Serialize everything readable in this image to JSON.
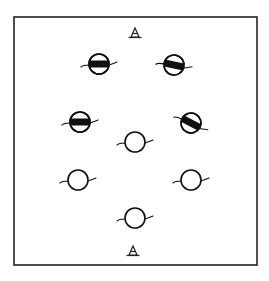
{
  "diagram": {
    "title": "",
    "frame": {
      "x": 14,
      "y": 17,
      "width": 243,
      "height": 248
    },
    "colors": {
      "stroke": "#111111",
      "background": "#ffffff"
    },
    "markers": [
      {
        "id": "top-marker",
        "type": "triangle",
        "x": 135,
        "y": 33
      },
      {
        "id": "bottom-marker",
        "type": "triangle",
        "x": 133,
        "y": 251
      }
    ],
    "figures": [
      {
        "id": "fig-1",
        "state": "half-filled",
        "x": 99,
        "y": 64,
        "tilt": 0
      },
      {
        "id": "fig-2",
        "state": "half-filled",
        "x": 174,
        "y": 65,
        "tilt": 12
      },
      {
        "id": "fig-3",
        "state": "half-filled",
        "x": 80,
        "y": 122,
        "tilt": 0
      },
      {
        "id": "fig-4",
        "state": "half-filled",
        "x": 191,
        "y": 123,
        "tilt": 28
      },
      {
        "id": "fig-5",
        "state": "open",
        "x": 135,
        "y": 142,
        "tilt": 0
      },
      {
        "id": "fig-6",
        "state": "open",
        "x": 78,
        "y": 180,
        "tilt": 0
      },
      {
        "id": "fig-7",
        "state": "open",
        "x": 191,
        "y": 180,
        "tilt": 0
      },
      {
        "id": "fig-8",
        "state": "open",
        "x": 135,
        "y": 218,
        "tilt": 0
      }
    ]
  }
}
